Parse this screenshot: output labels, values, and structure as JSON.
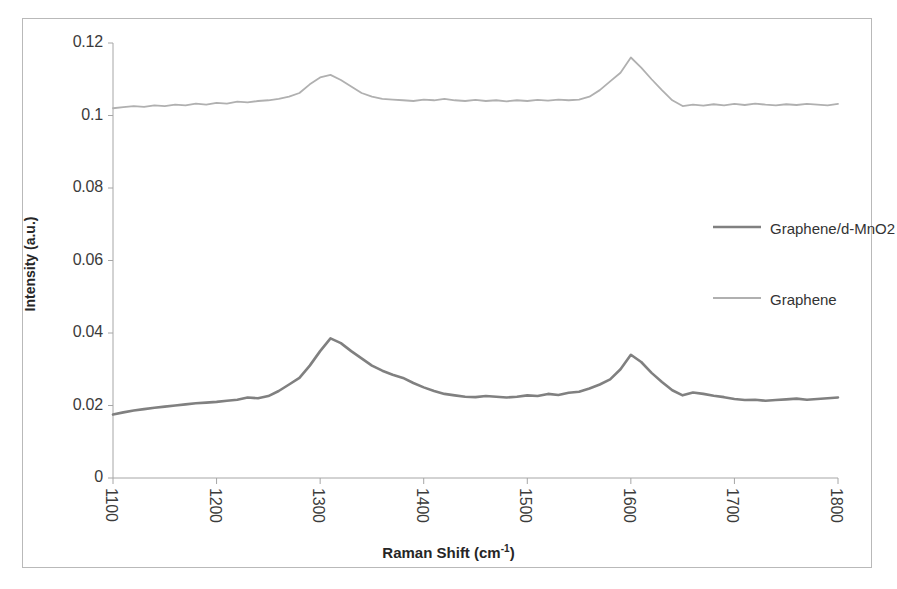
{
  "chart_data": {
    "type": "line",
    "title": "",
    "xlabel": "Raman Shift (cm-1)",
    "xlabel_base": "Raman Shift (cm",
    "xlabel_sup": "-1",
    "xlabel_tail": ")",
    "ylabel": "Intensity (a.u.)",
    "xlim": [
      1100,
      1800
    ],
    "ylim": [
      0,
      0.12
    ],
    "xticks": [
      "1100",
      "1200",
      "1300",
      "1400",
      "1500",
      "1600",
      "1700",
      "1800"
    ],
    "xtick_values": [
      1100,
      1200,
      1300,
      1400,
      1500,
      1600,
      1700,
      1800
    ],
    "yticks": [
      "0",
      "0.02",
      "0.04",
      "0.06",
      "0.08",
      "0.1",
      "0.12"
    ],
    "ytick_values": [
      0,
      0.02,
      0.04,
      0.06,
      0.08,
      0.1,
      0.12
    ],
    "grid": false,
    "legend_position": "center-right",
    "series": [
      {
        "name": "Graphene/d-MnO2",
        "color": "#808080",
        "line_width": 2.6,
        "x": [
          1100,
          1110,
          1120,
          1130,
          1140,
          1150,
          1160,
          1170,
          1180,
          1190,
          1200,
          1210,
          1220,
          1230,
          1240,
          1250,
          1260,
          1270,
          1280,
          1290,
          1300,
          1310,
          1320,
          1330,
          1340,
          1350,
          1360,
          1370,
          1380,
          1390,
          1400,
          1410,
          1420,
          1430,
          1440,
          1450,
          1460,
          1470,
          1480,
          1490,
          1500,
          1510,
          1520,
          1530,
          1540,
          1550,
          1560,
          1570,
          1580,
          1590,
          1600,
          1610,
          1620,
          1630,
          1640,
          1650,
          1660,
          1670,
          1680,
          1690,
          1700,
          1710,
          1720,
          1730,
          1740,
          1750,
          1760,
          1770,
          1780,
          1790,
          1800
        ],
        "y": [
          0.0175,
          0.0181,
          0.0186,
          0.019,
          0.0194,
          0.0197,
          0.02,
          0.0203,
          0.0206,
          0.0208,
          0.021,
          0.0213,
          0.0216,
          0.0222,
          0.022,
          0.0226,
          0.024,
          0.0258,
          0.0276,
          0.031,
          0.035,
          0.0385,
          0.0372,
          0.035,
          0.033,
          0.031,
          0.0296,
          0.0285,
          0.0276,
          0.0262,
          0.025,
          0.024,
          0.0232,
          0.0228,
          0.0224,
          0.0223,
          0.0226,
          0.0224,
          0.0222,
          0.0224,
          0.0228,
          0.0226,
          0.0232,
          0.0229,
          0.0235,
          0.0238,
          0.0247,
          0.0258,
          0.0272,
          0.03,
          0.034,
          0.032,
          0.029,
          0.0265,
          0.0242,
          0.0228,
          0.0236,
          0.0232,
          0.0227,
          0.0223,
          0.0218,
          0.0215,
          0.0216,
          0.0213,
          0.0215,
          0.0217,
          0.0219,
          0.0216,
          0.0218,
          0.022,
          0.0222
        ]
      },
      {
        "name": "Graphene",
        "color": "#b0b0b0",
        "line_width": 1.8,
        "x": [
          1100,
          1110,
          1120,
          1130,
          1140,
          1150,
          1160,
          1170,
          1180,
          1190,
          1200,
          1210,
          1220,
          1230,
          1240,
          1250,
          1260,
          1270,
          1280,
          1290,
          1300,
          1310,
          1320,
          1330,
          1340,
          1350,
          1360,
          1370,
          1380,
          1390,
          1400,
          1410,
          1420,
          1430,
          1440,
          1450,
          1460,
          1470,
          1480,
          1490,
          1500,
          1510,
          1520,
          1530,
          1540,
          1550,
          1560,
          1570,
          1580,
          1590,
          1600,
          1610,
          1620,
          1630,
          1640,
          1650,
          1660,
          1670,
          1680,
          1690,
          1700,
          1710,
          1720,
          1730,
          1740,
          1750,
          1760,
          1770,
          1780,
          1790,
          1800
        ],
        "y": [
          0.102,
          0.1023,
          0.1026,
          0.1024,
          0.1028,
          0.1026,
          0.103,
          0.1028,
          0.1033,
          0.103,
          0.1035,
          0.1033,
          0.1038,
          0.1036,
          0.104,
          0.1042,
          0.1046,
          0.1052,
          0.1062,
          0.1086,
          0.1105,
          0.1112,
          0.1098,
          0.108,
          0.1062,
          0.1052,
          0.1046,
          0.1044,
          0.1042,
          0.104,
          0.1044,
          0.1042,
          0.1046,
          0.1042,
          0.104,
          0.1043,
          0.104,
          0.1042,
          0.1039,
          0.1042,
          0.104,
          0.1043,
          0.1041,
          0.1044,
          0.1042,
          0.1044,
          0.1052,
          0.107,
          0.1094,
          0.1118,
          0.116,
          0.1132,
          0.11,
          0.107,
          0.1042,
          0.1026,
          0.103,
          0.1027,
          0.1031,
          0.1028,
          0.1032,
          0.1029,
          0.1033,
          0.103,
          0.1028,
          0.1031,
          0.1029,
          0.1032,
          0.103,
          0.1028,
          0.1032
        ]
      }
    ]
  },
  "legend": {
    "entries": [
      {
        "label": "Graphene/d-MnO2",
        "color": "#808080",
        "width": 2.6
      },
      {
        "label": "Graphene",
        "color": "#b0b0b0",
        "width": 1.8
      }
    ]
  },
  "axes": {
    "y_title": "Intensity (a.u.)",
    "x_title_base": "Raman Shift (cm",
    "x_title_sup": "-1",
    "x_title_tail": ")"
  },
  "colors": {
    "frame": "#b9b9b9",
    "axis": "#a6a6a6",
    "tick_text": "#3b3b3b",
    "title_text": "#262626",
    "series_dark": "#808080",
    "series_light": "#b0b0b0",
    "background": "#ffffff"
  }
}
